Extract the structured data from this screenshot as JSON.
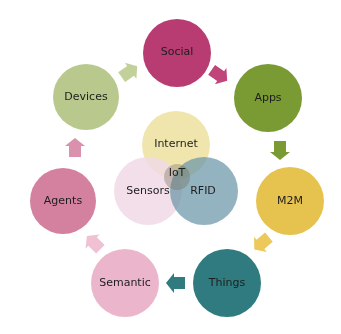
{
  "diagram": {
    "center": {
      "label": "IoT",
      "circles": [
        {
          "label": "Internet",
          "color": "#efe0a0"
        },
        {
          "label": "Sensors",
          "color": "#f1d9e6"
        },
        {
          "label": "RFID",
          "color": "#7fa7b5"
        }
      ]
    },
    "cycle": [
      {
        "label": "Social",
        "color": "#b83c72"
      },
      {
        "label": "Apps",
        "color": "#7a9a34"
      },
      {
        "label": "M2M",
        "color": "#e6c24e"
      },
      {
        "label": "Things",
        "color": "#2f7b7f"
      },
      {
        "label": "Semantic",
        "color": "#ebb6cb"
      },
      {
        "label": "Agents",
        "color": "#d3819f"
      },
      {
        "label": "Devices",
        "color": "#b9c98e"
      }
    ],
    "arrow_colors": [
      "#c0457a",
      "#7a9a34",
      "#ecc95a",
      "#2f7b7f",
      "#f0c1d2",
      "#d991ad",
      "#c2d09a"
    ]
  }
}
